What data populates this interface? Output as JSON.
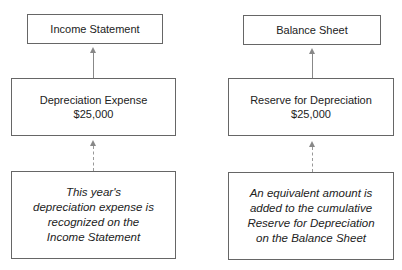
{
  "left": {
    "top_box": {
      "label": "Income Statement"
    },
    "middle_box": {
      "title": "Depreciation Expense",
      "amount": "$25,000"
    },
    "bottom_box": {
      "lines": [
        "This year's",
        "depreciation expense is",
        "recognized on the",
        "Income Statement"
      ]
    }
  },
  "right": {
    "top_box": {
      "label": "Balance Sheet"
    },
    "middle_box": {
      "title": "Reserve for Depreciation",
      "amount": "$25,000"
    },
    "bottom_box": {
      "lines": [
        "An equivalent amount is",
        "added to the cumulative",
        "Reserve for Depreciation",
        "on the Balance Sheet"
      ]
    }
  },
  "colors": {
    "border": "#666666",
    "arrow": "#888888"
  }
}
